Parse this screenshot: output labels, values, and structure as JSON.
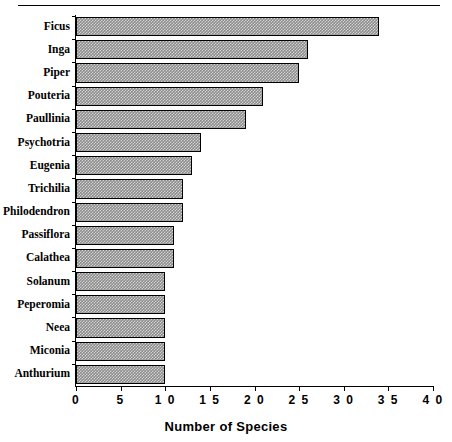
{
  "chart_data": {
    "type": "bar",
    "orientation": "horizontal",
    "title": "",
    "xlabel": "Number of Species",
    "ylabel": "",
    "xlim": [
      0,
      40
    ],
    "xticks": [
      0,
      5,
      10,
      15,
      20,
      25,
      30,
      35,
      40
    ],
    "xtick_labels": [
      "0",
      "5",
      "1 0",
      "1 5",
      "2 0",
      "2 5",
      "3 0",
      "3 5",
      "4 0"
    ],
    "grid": false,
    "legend": null,
    "bar_fill_color": "#8d8d8d",
    "bar_edge_color": "#000000",
    "categories": [
      "Ficus",
      "Inga",
      "Piper",
      "Pouteria",
      "Paullinia",
      "Psychotria",
      "Eugenia",
      "Trichilia",
      "Philodendron",
      "Passiflora",
      "Calathea",
      "Solanum",
      "Peperomia",
      "Neea",
      "Miconia",
      "Anthurium"
    ],
    "values": [
      34,
      26,
      25,
      21,
      19,
      14,
      13,
      12,
      12,
      11,
      11,
      10,
      10,
      10,
      10,
      10
    ]
  }
}
